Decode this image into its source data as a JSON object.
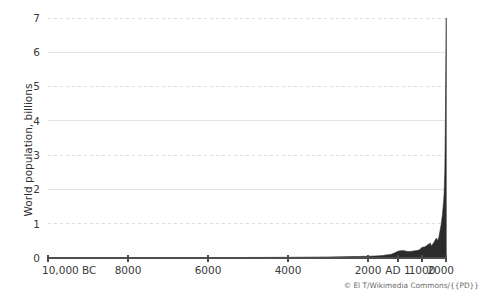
{
  "chart_data": {
    "type": "area",
    "title": "",
    "subtitle": "",
    "xlabel": "",
    "ylabel": "World population, billions",
    "ylim": [
      0,
      7
    ],
    "yticks": [
      0,
      1,
      2,
      3,
      4,
      5,
      6,
      7
    ],
    "ytick_labels": [
      "0",
      "1",
      "2",
      "3",
      "4",
      "5",
      "6",
      "7"
    ],
    "xtick_labels": [
      "10,000 BC",
      "8000",
      "6000",
      "4000",
      "2000",
      "AD 1",
      "1000",
      "2000"
    ],
    "xtick_years": [
      -10000,
      -8000,
      -6000,
      -4000,
      -2000,
      1,
      1000,
      2000
    ],
    "xtick_positions_px": [
      48,
      128,
      208,
      288,
      368,
      398,
      422,
      446
    ],
    "grid": true,
    "grid_style": {
      "odd_values_dashed": [
        1,
        3,
        5,
        7
      ],
      "even_values_solid": [
        2,
        4,
        6
      ],
      "solid_color": "#e2e2e2",
      "dashed_color": "#dddddd"
    },
    "legend": "none",
    "series": [
      {
        "name": "World population",
        "fill_color": "#2b2b2b",
        "x": [
          -10000,
          -9000,
          -8000,
          -7000,
          -6000,
          -5000,
          -4000,
          -3000,
          -2000,
          -1500,
          -1000,
          -800,
          -500,
          -400,
          -200,
          1,
          200,
          400,
          500,
          600,
          700,
          800,
          900,
          1000,
          1100,
          1200,
          1250,
          1300,
          1340,
          1400,
          1500,
          1600,
          1650,
          1700,
          1750,
          1800,
          1850,
          1900,
          1910,
          1920,
          1930,
          1940,
          1950,
          1960,
          1970,
          1980,
          1990,
          2000,
          2011
        ],
        "values": [
          0.004,
          0.005,
          0.005,
          0.007,
          0.01,
          0.015,
          0.02,
          0.03,
          0.05,
          0.06,
          0.07,
          0.09,
          0.1,
          0.12,
          0.15,
          0.2,
          0.22,
          0.19,
          0.19,
          0.2,
          0.21,
          0.22,
          0.24,
          0.31,
          0.32,
          0.36,
          0.4,
          0.4,
          0.44,
          0.35,
          0.46,
          0.58,
          0.5,
          0.6,
          0.79,
          0.98,
          1.26,
          1.65,
          1.75,
          1.86,
          2.07,
          2.3,
          2.52,
          3.02,
          3.7,
          4.44,
          5.32,
          6.14,
          7.0
        ],
        "units": "billions"
      }
    ],
    "annotations": [
      {
        "text": "© El T/Wikimedia Commons/{{PD}}",
        "position": "bottom-right"
      }
    ]
  },
  "axis": {
    "y_title": "World population, billions",
    "y_ticks": [
      "7",
      "6",
      "5",
      "4",
      "3",
      "2",
      "1",
      "0"
    ],
    "x_ticks": [
      "10,000 BC",
      "8000",
      "6000",
      "4000",
      "2000",
      "AD 1",
      "1000",
      "2000"
    ]
  },
  "attribution": {
    "text": "© El T/Wikimedia Commons/{{PD}}"
  },
  "colors": {
    "area_fill": "#2b2b2b",
    "axis": "#4d4d4d",
    "grid_solid": "#e2e2e2",
    "grid_dashed": "#dddddd",
    "text": "#3a3a3a",
    "attribution_text": "#6b6b6b",
    "background": "#ffffff"
  }
}
